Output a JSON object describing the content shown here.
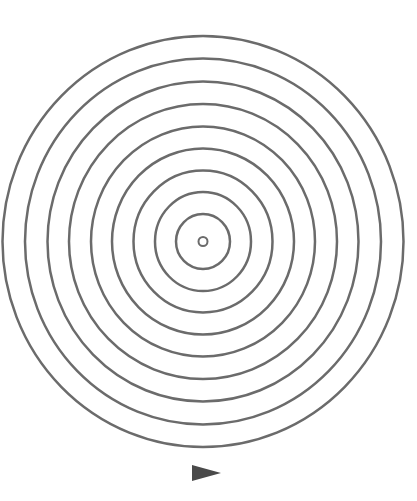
{
  "diagram": {
    "type": "concentric-rings",
    "background": "#ffffff",
    "stroke_color": "#6b6b6b",
    "stroke_width": 2.5,
    "center": {
      "x": 203,
      "y": 241.5
    },
    "center_dot": {
      "rx": 4.5,
      "ry": 4.5
    },
    "rings": [
      {
        "rx": 27,
        "ry": 27.5
      },
      {
        "rx": 48,
        "ry": 49.5
      },
      {
        "rx": 69.5,
        "ry": 71
      },
      {
        "rx": 91,
        "ry": 93
      },
      {
        "rx": 112,
        "ry": 115
      },
      {
        "rx": 134,
        "ry": 137.5
      },
      {
        "rx": 155.5,
        "ry": 160
      },
      {
        "rx": 178,
        "ry": 183
      },
      {
        "rx": 200.5,
        "ry": 205.5
      }
    ],
    "arrow": {
      "icon": "right-pointing-triangle",
      "direction": "right",
      "color": "#4a4a4a",
      "points": [
        [
          192,
          465
        ],
        [
          221,
          473
        ],
        [
          192,
          481
        ]
      ]
    }
  }
}
